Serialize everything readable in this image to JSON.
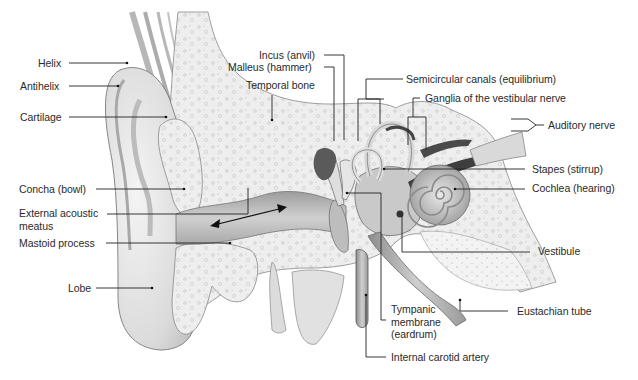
{
  "diagram": {
    "labels": {
      "helix": "Helix",
      "antihelix": "Antihelix",
      "cartilage": "Cartilage",
      "concha": "Concha (bowl)",
      "external_acoustic_meatus": "External acoustic\nmeatus",
      "mastoid_process": "Mastoid process",
      "lobe": "Lobe",
      "incus": "Incus (anvil)",
      "malleus": "Malleus (hammer)",
      "temporal_bone": "Temporal bone",
      "semicircular_canals": "Semicircular canals (equilibrium)",
      "ganglia_vestibular_nerve": "Ganglia of the vestibular nerve",
      "auditory_nerve": "Auditory nerve",
      "stapes": "Stapes (stirrup)",
      "cochlea": "Cochlea (hearing)",
      "vestibule": "Vestibule",
      "eustachian_tube": "Eustachian tube",
      "tympanic_membrane": "Tympanic\nmembrane\n(eardrum)",
      "internal_carotid_artery": "Internal carotid artery"
    },
    "colors": {
      "background": "#ffffff",
      "text": "#2a2a2a",
      "leader_lines": "#222222",
      "bone": "#ececec",
      "skin": "#dcdcdc",
      "canal": "#b9b9b9",
      "dark_tissue": "#5a5a5a"
    }
  }
}
